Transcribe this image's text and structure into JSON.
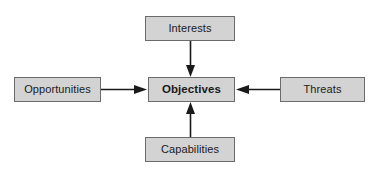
{
  "diagram": {
    "background_color": "#ffffff",
    "node_fill_color": "#d3d3d3",
    "node_border_color": "#6b6b6b",
    "edge_color": "#1a1a1a",
    "nodes": {
      "interests": {
        "label": "Interests"
      },
      "objectives": {
        "label": "Objectives"
      },
      "opportunities": {
        "label": "Opportunities"
      },
      "threats": {
        "label": "Threats"
      },
      "capabilities": {
        "label": "Capabilities"
      }
    },
    "edges": [
      {
        "id": "interests-to-objectives",
        "from": "Interests",
        "to": "Objectives",
        "direction": "down",
        "arrowhead": "filled-triangle"
      },
      {
        "id": "opportunities-to-objectives",
        "from": "Opportunities",
        "to": "Objectives",
        "direction": "right",
        "arrowhead": "filled-triangle"
      },
      {
        "id": "threats-to-objectives",
        "from": "Threats",
        "to": "Objectives",
        "direction": "left",
        "arrowhead": "filled-triangle"
      },
      {
        "id": "capabilities-to-objectives",
        "from": "Capabilities",
        "to": "Objectives",
        "direction": "up",
        "arrowhead": "filled-triangle"
      }
    ]
  }
}
